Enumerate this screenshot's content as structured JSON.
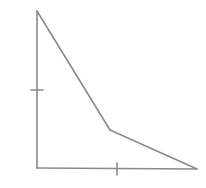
{
  "diagram": {
    "type": "geometry-figure",
    "stroke_color": "#8a8a8a",
    "stroke_width": 1.6,
    "vertices": {
      "top": [
        37,
        11
      ],
      "bottom_left": [
        37,
        168
      ],
      "bottom_right": [
        197,
        169
      ],
      "bend": [
        110,
        130
      ]
    },
    "edges": [
      {
        "name": "left-side",
        "from": "top",
        "to": "bottom_left"
      },
      {
        "name": "bottom-side",
        "from": "bottom_left",
        "to": "bottom_right"
      },
      {
        "name": "lower-slant",
        "from": "bottom_right",
        "to": "bend"
      },
      {
        "name": "upper-slant",
        "from": "bend",
        "to": "top"
      }
    ],
    "tick_marks": [
      {
        "name": "left-side-tick",
        "orientation": "horizontal",
        "x1": 31,
        "y1": 90,
        "x2": 43,
        "y2": 90
      },
      {
        "name": "bottom-side-tick",
        "orientation": "vertical",
        "x1": 117,
        "y1": 163,
        "x2": 117,
        "y2": 175
      }
    ]
  }
}
